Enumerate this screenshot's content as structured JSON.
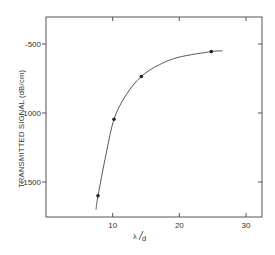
{
  "chart_data": {
    "type": "line",
    "title": "",
    "xlabel": "λ/d",
    "ylabel": "TRANSMITTED SIGNAL (dB/cm)",
    "xlim": [
      0,
      32.5
    ],
    "ylim": [
      -1800,
      -300
    ],
    "x_ticks": [
      10,
      20,
      30
    ],
    "x_tick_labels": [
      "10",
      "20",
      "30"
    ],
    "y_ticks": [
      -500,
      -1000,
      -1500
    ],
    "y_tick_labels": [
      "-500",
      "-1000",
      "-1500"
    ],
    "grid": false,
    "legend": null,
    "series": [
      {
        "name": "measured points",
        "x": [
          7.8,
          10.2,
          14.3,
          24.8
        ],
        "y": [
          -1600,
          -1045,
          -735,
          -555
        ]
      },
      {
        "name": "fitted curve",
        "x": [
          7.5,
          7.8,
          9.0,
          10.2,
          12.0,
          14.3,
          17.0,
          20.0,
          24.8,
          26.5
        ],
        "y": [
          -1700,
          -1600,
          -1300,
          -1045,
          -870,
          -735,
          -650,
          -595,
          -555,
          -550
        ]
      }
    ]
  },
  "axes": {
    "x_label_main": "λ",
    "x_label_sub": "d",
    "y_label_main": "TRANSMITTED SIGNAL",
    "y_label_unit": "(dB/cm)"
  }
}
